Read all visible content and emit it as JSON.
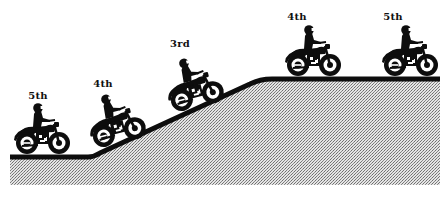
{
  "diagram": {
    "colors": {
      "ink": "#0d0d0d",
      "ground_light": "#d9d9d9",
      "ground_dark": "#8a8a8a",
      "background": "#ffffff"
    },
    "road": {
      "points": [
        [
          10,
          157
        ],
        [
          88,
          157
        ],
        [
          98,
          153
        ],
        [
          250,
          84
        ],
        [
          272,
          79
        ],
        [
          446,
          79
        ]
      ],
      "stroke_width": 5
    },
    "riders": [
      {
        "id": "rider-1",
        "gear_label": "5th",
        "section": "flat-bottom",
        "label_x": 38,
        "label_y": 90,
        "bike_x": 42,
        "bike_y": 154,
        "tilt": 0
      },
      {
        "id": "rider-2",
        "gear_label": "4th",
        "section": "slope-start",
        "label_x": 103,
        "label_y": 78,
        "bike_x": 121,
        "bike_y": 143,
        "tilt": -14
      },
      {
        "id": "rider-3",
        "gear_label": "3rd",
        "section": "slope-mid",
        "label_x": 180,
        "label_y": 38,
        "bike_x": 199,
        "bike_y": 107,
        "tilt": -14
      },
      {
        "id": "rider-4",
        "gear_label": "4th",
        "section": "flat-top",
        "label_x": 297,
        "label_y": 11,
        "bike_x": 313,
        "bike_y": 76,
        "tilt": 0
      },
      {
        "id": "rider-5",
        "gear_label": "5th",
        "section": "flat-top",
        "label_x": 393,
        "label_y": 11,
        "bike_x": 410,
        "bike_y": 76,
        "tilt": 0
      }
    ]
  }
}
